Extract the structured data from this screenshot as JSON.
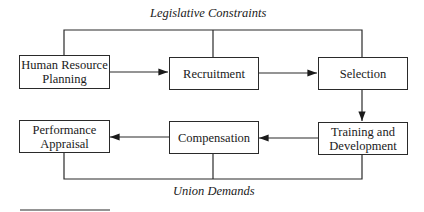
{
  "diagram": {
    "top_constraint": "Legislative Constraints",
    "bottom_constraint": "Union Demands",
    "nodes": {
      "hrp": "Human Resource Planning",
      "recruitment": "Recruitment",
      "selection": "Selection",
      "training": "Training and Development",
      "compensation": "Compensation",
      "appraisal": "Performance Appraisal"
    },
    "flow": [
      "hrp",
      "recruitment",
      "selection",
      "training",
      "compensation",
      "appraisal"
    ]
  }
}
